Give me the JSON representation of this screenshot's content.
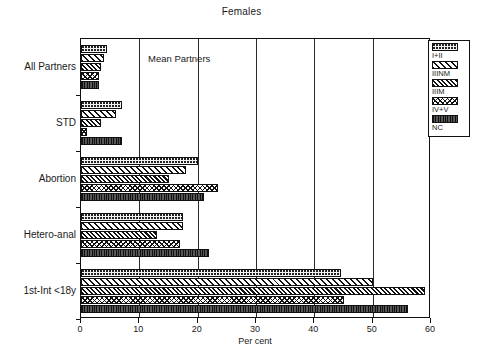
{
  "chart_data": {
    "type": "bar",
    "orientation": "horizontal",
    "title": "Females",
    "xlabel": "Per cent",
    "ylabel": "",
    "xlim": [
      0,
      60
    ],
    "xticks": [
      0,
      10,
      20,
      30,
      40,
      50,
      60
    ],
    "grid": "vertical",
    "legend_position": "top-right",
    "annotation": "Mean Partners",
    "categories": [
      "All Partners",
      "STD",
      "Abortion",
      "Hetero-anal",
      "1st-Int <18y"
    ],
    "series": [
      {
        "name": "I+II",
        "pattern": "dots",
        "values": [
          4.5,
          7.0,
          20.0,
          17.5,
          44.5
        ]
      },
      {
        "name": "IIINM",
        "pattern": "diag",
        "values": [
          4.0,
          6.0,
          18.0,
          17.5,
          50.0
        ]
      },
      {
        "name": "IIIM",
        "pattern": "diag-dense",
        "values": [
          3.5,
          3.5,
          15.0,
          13.0,
          59.0
        ]
      },
      {
        "name": "IV+V",
        "pattern": "cross",
        "values": [
          3.0,
          1.0,
          23.5,
          17.0,
          45.0
        ]
      },
      {
        "name": "NC",
        "pattern": "solid",
        "values": [
          3.0,
          7.0,
          21.0,
          22.0,
          56.0
        ]
      }
    ]
  },
  "legend": {
    "items": [
      {
        "label": "I+II"
      },
      {
        "label": "IIINM"
      },
      {
        "label": "IIIM"
      },
      {
        "label": "IV+V"
      },
      {
        "label": "NC"
      }
    ]
  }
}
